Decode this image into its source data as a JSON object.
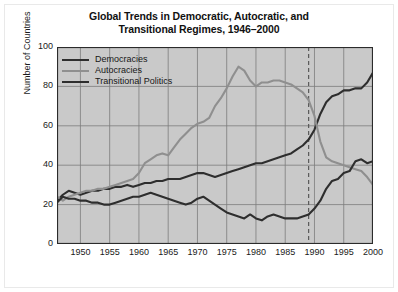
{
  "figure": {
    "title_line1": "Global Trends in Democratic, Autocratic, and",
    "title_line2": "Transitional Regimes, 1946–2000",
    "background_color": "#ffffff",
    "plot_background_color": "#c9c9c9",
    "grid_color": "#7c7c7c",
    "axis_color": "#2b2b2b"
  },
  "legend": {
    "position": "top-left-inside",
    "items": [
      {
        "label": "Democracies",
        "color": "#2e2e2e"
      },
      {
        "label": "Autocracies",
        "color": "#8f8f8f"
      },
      {
        "label": "Transitional Politics",
        "color": "#2e2e2e"
      }
    ]
  },
  "axes": {
    "ylabel": "Number of Countries",
    "yticks": [
      "0",
      "20",
      "40",
      "60",
      "80",
      "100"
    ],
    "xticks": [
      "1950",
      "1955",
      "1960",
      "1965",
      "1970",
      "1975",
      "1980",
      "1985",
      "1990",
      "1995",
      "2000"
    ]
  },
  "annotations": {
    "vertical_marker_year": 1989,
    "vertical_marker_style": "dashed",
    "vertical_marker_color": "#5a5a5a"
  },
  "chart_data": {
    "type": "line",
    "title": "Global Trends in Democratic, Autocratic, and Transitional Regimes, 1946–2000",
    "xlabel": "",
    "ylabel": "Number of Countries",
    "xlim": [
      1946,
      2000
    ],
    "ylim": [
      0,
      100
    ],
    "grid": true,
    "legend_position": "upper left",
    "x": [
      1946,
      1947,
      1948,
      1949,
      1950,
      1951,
      1952,
      1953,
      1954,
      1955,
      1956,
      1957,
      1958,
      1959,
      1960,
      1961,
      1962,
      1963,
      1964,
      1965,
      1966,
      1967,
      1968,
      1969,
      1970,
      1971,
      1972,
      1973,
      1974,
      1975,
      1976,
      1977,
      1978,
      1979,
      1980,
      1981,
      1982,
      1983,
      1984,
      1985,
      1986,
      1987,
      1988,
      1989,
      1990,
      1991,
      1992,
      1993,
      1994,
      1995,
      1996,
      1997,
      1998,
      1999,
      2000
    ],
    "series": [
      {
        "name": "Democracies",
        "color": "#2e2e2e",
        "values": [
          22,
          25,
          27,
          26,
          25,
          26,
          27,
          27,
          28,
          28,
          29,
          29,
          30,
          29,
          30,
          31,
          31,
          32,
          32,
          33,
          33,
          33,
          34,
          35,
          36,
          36,
          35,
          34,
          35,
          36,
          37,
          38,
          39,
          40,
          41,
          41,
          42,
          43,
          44,
          45,
          46,
          48,
          50,
          53,
          58,
          66,
          72,
          75,
          76,
          78,
          78,
          79,
          79,
          82,
          87
        ]
      },
      {
        "name": "Autocracies",
        "color": "#8f8f8f",
        "values": [
          24,
          22,
          24,
          25,
          26,
          27,
          27,
          28,
          28,
          29,
          30,
          31,
          32,
          33,
          36,
          41,
          43,
          45,
          46,
          45,
          49,
          53,
          56,
          59,
          61,
          62,
          64,
          70,
          74,
          79,
          85,
          90,
          88,
          83,
          80,
          82,
          82,
          83,
          83,
          82,
          81,
          79,
          77,
          73,
          65,
          52,
          44,
          42,
          41,
          40,
          39,
          38,
          37,
          34,
          30
        ]
      },
      {
        "name": "Transitional Politics",
        "color": "#2e2e2e",
        "values": [
          21,
          24,
          23,
          23,
          22,
          22,
          21,
          21,
          20,
          20,
          21,
          22,
          23,
          24,
          24,
          25,
          26,
          25,
          24,
          23,
          22,
          21,
          20,
          21,
          23,
          24,
          22,
          20,
          18,
          16,
          15,
          14,
          13,
          15,
          13,
          12,
          14,
          15,
          14,
          13,
          13,
          13,
          14,
          15,
          18,
          22,
          28,
          32,
          33,
          36,
          37,
          42,
          43,
          41,
          42
        ]
      }
    ]
  }
}
